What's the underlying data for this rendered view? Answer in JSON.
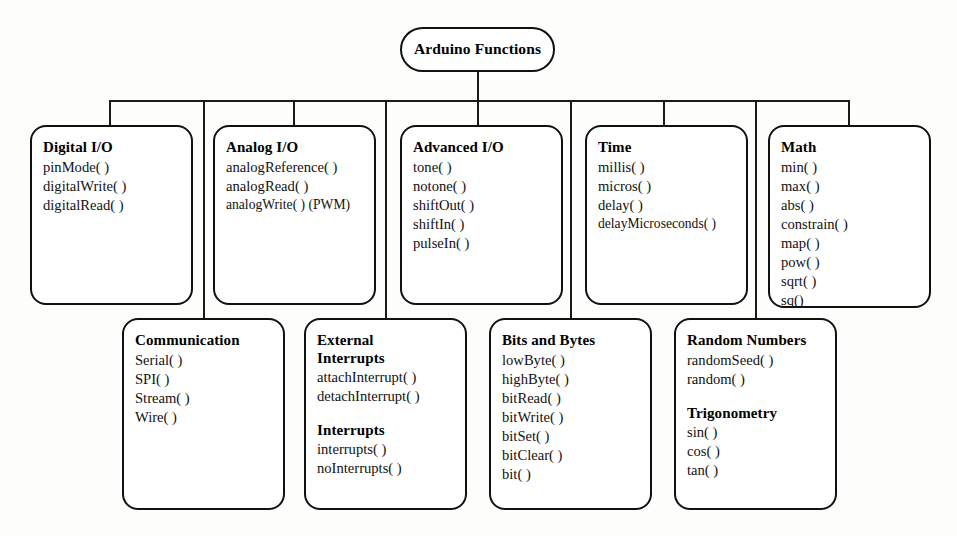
{
  "diagram": {
    "root": {
      "label": "Arduino Functions"
    },
    "top_row": [
      {
        "id": "digital-io",
        "sections": [
          {
            "title": "Digital I/O",
            "functions": [
              "pinMode( )",
              "digitalWrite( )",
              "digitalRead( )"
            ]
          }
        ]
      },
      {
        "id": "analog-io",
        "sections": [
          {
            "title": "Analog I/O",
            "functions": [
              "analogReference( )",
              "analogRead( )",
              "analogWrite( ) (PWM)"
            ]
          }
        ]
      },
      {
        "id": "advanced-io",
        "sections": [
          {
            "title": "Advanced I/O",
            "functions": [
              "tone( )",
              "notone( )",
              "shiftOut( )",
              "shiftIn( )",
              "pulseIn( )"
            ]
          }
        ]
      },
      {
        "id": "time",
        "sections": [
          {
            "title": "Time",
            "functions": [
              "millis( )",
              "micros( )",
              "delay( )",
              "delayMicroseconds( )"
            ]
          }
        ]
      },
      {
        "id": "math",
        "sections": [
          {
            "title": "Math",
            "functions": [
              "min( )",
              "max( )",
              "abs( )",
              "constrain( )",
              "map( )",
              "pow( )",
              "sqrt( )",
              "sq()"
            ]
          }
        ]
      }
    ],
    "bottom_row": [
      {
        "id": "communication",
        "sections": [
          {
            "title": "Communication",
            "functions": [
              "Serial( )",
              "SPI( )",
              "Stream( )",
              "Wire( )"
            ]
          }
        ]
      },
      {
        "id": "external-interrupts",
        "sections": [
          {
            "title": "External",
            "title2": "Interrupts",
            "functions": [
              "attachInterrupt( )",
              "detachInterrupt( )"
            ]
          },
          {
            "title": "Interrupts",
            "functions": [
              "interrupts( )",
              "noInterrupts( )"
            ]
          }
        ]
      },
      {
        "id": "bits-and-bytes",
        "sections": [
          {
            "title": "Bits and Bytes",
            "functions": [
              "lowByte( )",
              "highByte( )",
              "bitRead( )",
              "bitWrite( )",
              "bitSet( )",
              "bitClear( )",
              "bit( )"
            ]
          }
        ]
      },
      {
        "id": "random-trig",
        "sections": [
          {
            "title": "Random Numbers",
            "functions": [
              "randomSeed( )",
              "random( )"
            ]
          },
          {
            "title": "Trigonometry",
            "functions": [
              "sin( )",
              "cos( )",
              "tan( )"
            ]
          }
        ]
      }
    ]
  }
}
